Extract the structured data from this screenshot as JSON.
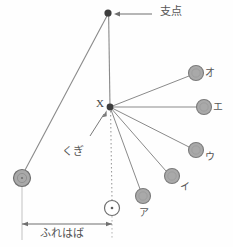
{
  "figure": {
    "width": 233,
    "height": 247,
    "background_color": "#fefefe",
    "line_color": "#8a8a8a",
    "ball_fill": "#a9a9a9",
    "ball_stroke": "#7b7b7b",
    "text_color": "#555555",
    "pivot_color": "#3d3d3d"
  },
  "labels": {
    "pivot": "支点",
    "nail_point": "X",
    "nail": "くぎ",
    "amplitude": "ふれはば",
    "ball_a": "ア",
    "ball_i": "イ",
    "ball_u": "ウ",
    "ball_e": "エ",
    "ball_o": "オ"
  },
  "points": {
    "pivot": {
      "x": 108,
      "y": 13,
      "r": 3.6
    },
    "nail": {
      "x": 110,
      "y": 107,
      "r": 3.4
    },
    "release_ball": {
      "x": 22,
      "y": 178,
      "r": 8.5
    },
    "rest_ball": {
      "x": 112,
      "y": 208,
      "r": 7.5
    }
  },
  "balls": [
    {
      "key": "ball_a",
      "label": "ア",
      "x": 143,
      "y": 196,
      "r": 7.5,
      "label_x": 143,
      "label_y": 214
    },
    {
      "key": "ball_i",
      "label": "イ",
      "x": 172,
      "y": 176,
      "r": 7.5,
      "label_x": 184,
      "label_y": 187
    },
    {
      "key": "ball_u",
      "label": "ウ",
      "x": 196,
      "y": 150,
      "r": 7.5,
      "label_x": 209,
      "label_y": 159
    },
    {
      "key": "ball_e",
      "label": "エ",
      "x": 204,
      "y": 107,
      "r": 7.5,
      "label_x": 217,
      "label_y": 112
    },
    {
      "key": "ball_o",
      "label": "オ",
      "x": 196,
      "y": 73,
      "r": 7.5,
      "label_x": 209,
      "label_y": 78
    }
  ],
  "annotations": {
    "pivot_arrow": {
      "from_x": 152,
      "from_y": 14,
      "to_x": 116,
      "to_y": 14
    },
    "nail_arrow": {
      "from_x": 90,
      "from_y": 134,
      "to_x": 104,
      "to_y": 113
    },
    "amplitude_arrow": {
      "x1": 22,
      "x2": 112,
      "y": 224
    }
  },
  "text_positions": {
    "pivot_label": {
      "x": 160,
      "y": 8
    },
    "nail_point_label": {
      "x": 97,
      "y": 100
    },
    "nail_label": {
      "x": 62,
      "y": 146
    },
    "amplitude_label": {
      "x": 42,
      "y": 230
    }
  }
}
